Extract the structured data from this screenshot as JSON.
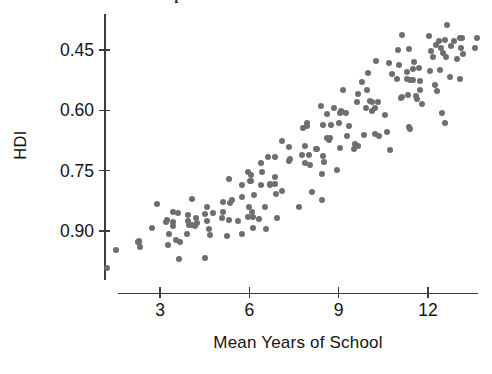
{
  "figure": {
    "caption_cutoff": "the HDI. Here is a scatterplot",
    "background_color": "#ffffff",
    "point_color": "#6e6e6e",
    "axis_color": "#3c3c3c"
  },
  "axes": {
    "y_title": "HDI",
    "x_title": "Mean Years of School",
    "y_ticks": [
      "0.90",
      "0.75",
      "0.60",
      "0.45"
    ],
    "x_ticks": [
      "3",
      "6",
      "9",
      "12"
    ]
  },
  "chart_data": {
    "type": "scatter",
    "title": "",
    "xlabel": "Mean Years of School",
    "ylabel": "HDI",
    "xlim": [
      1.2,
      13.6
    ],
    "ylim": [
      0.355,
      0.975
    ],
    "xticks": [
      3,
      6,
      9,
      12
    ],
    "yticks": [
      0.45,
      0.6,
      0.75,
      0.9
    ],
    "grid": false,
    "legend": false,
    "marker_color": "#6e6e6e",
    "marker_size": 6,
    "n_points": 186,
    "points": [
      [
        1.5,
        0.385
      ],
      [
        1.9,
        0.415
      ],
      [
        2.2,
        0.448
      ],
      [
        2.4,
        0.398
      ],
      [
        2.6,
        0.432
      ],
      [
        2.7,
        0.462
      ],
      [
        2.9,
        0.418
      ],
      [
        3.0,
        0.452
      ],
      [
        3.1,
        0.372
      ],
      [
        3.2,
        0.488
      ],
      [
        3.3,
        0.44
      ],
      [
        3.4,
        0.47
      ],
      [
        3.5,
        0.425
      ],
      [
        3.6,
        0.455
      ],
      [
        3.7,
        0.5
      ],
      [
        3.8,
        0.441
      ],
      [
        3.9,
        0.478
      ],
      [
        4.0,
        0.432
      ],
      [
        4.1,
        0.462
      ],
      [
        4.2,
        0.492
      ],
      [
        4.3,
        0.45
      ],
      [
        4.4,
        0.418
      ],
      [
        4.5,
        0.47
      ],
      [
        4.6,
        0.505
      ],
      [
        4.7,
        0.448
      ],
      [
        4.8,
        0.478
      ],
      [
        4.9,
        0.52
      ],
      [
        5.0,
        0.462
      ],
      [
        5.1,
        0.498
      ],
      [
        5.2,
        0.455
      ],
      [
        5.3,
        0.53
      ],
      [
        5.4,
        0.485
      ],
      [
        5.5,
        0.512
      ],
      [
        5.6,
        0.468
      ],
      [
        5.7,
        0.545
      ],
      [
        5.8,
        0.502
      ],
      [
        5.9,
        0.478
      ],
      [
        6.0,
        0.536
      ],
      [
        6.1,
        0.56
      ],
      [
        6.2,
        0.508
      ],
      [
        6.3,
        0.548
      ],
      [
        6.4,
        0.592
      ],
      [
        6.5,
        0.52
      ],
      [
        6.6,
        0.572
      ],
      [
        6.7,
        0.61
      ],
      [
        6.8,
        0.545
      ],
      [
        6.9,
        0.588
      ],
      [
        7.0,
        0.625
      ],
      [
        7.1,
        0.556
      ],
      [
        7.2,
        0.602
      ],
      [
        7.3,
        0.64
      ],
      [
        7.4,
        0.58
      ],
      [
        7.5,
        0.618
      ],
      [
        7.6,
        0.662
      ],
      [
        7.7,
        0.596
      ],
      [
        7.8,
        0.645
      ],
      [
        7.9,
        0.69
      ],
      [
        8.0,
        0.612
      ],
      [
        8.1,
        0.658
      ],
      [
        8.2,
        0.702
      ],
      [
        8.3,
        0.63
      ],
      [
        8.4,
        0.675
      ],
      [
        8.5,
        0.718
      ],
      [
        8.6,
        0.648
      ],
      [
        8.7,
        0.692
      ],
      [
        8.8,
        0.735
      ],
      [
        8.9,
        0.665
      ],
      [
        9.0,
        0.708
      ],
      [
        9.1,
        0.75
      ],
      [
        9.2,
        0.682
      ],
      [
        9.3,
        0.725
      ],
      [
        9.4,
        0.765
      ],
      [
        9.5,
        0.7
      ],
      [
        9.6,
        0.742
      ],
      [
        9.7,
        0.782
      ],
      [
        9.8,
        0.715
      ],
      [
        9.9,
        0.758
      ],
      [
        10.0,
        0.798
      ],
      [
        10.1,
        0.73
      ],
      [
        10.2,
        0.772
      ],
      [
        10.3,
        0.812
      ],
      [
        10.4,
        0.745
      ],
      [
        10.5,
        0.788
      ],
      [
        10.6,
        0.828
      ],
      [
        10.7,
        0.76
      ],
      [
        10.8,
        0.802
      ],
      [
        10.9,
        0.842
      ],
      [
        11.0,
        0.775
      ],
      [
        11.1,
        0.818
      ],
      [
        11.2,
        0.858
      ],
      [
        11.3,
        0.79
      ],
      [
        11.4,
        0.832
      ],
      [
        11.5,
        0.872
      ],
      [
        11.6,
        0.805
      ],
      [
        11.7,
        0.848
      ],
      [
        11.8,
        0.888
      ],
      [
        11.9,
        0.82
      ],
      [
        12.0,
        0.862
      ],
      [
        12.1,
        0.9
      ],
      [
        12.2,
        0.835
      ],
      [
        12.3,
        0.878
      ],
      [
        12.4,
        0.915
      ],
      [
        12.5,
        0.85
      ],
      [
        12.6,
        0.892
      ],
      [
        12.7,
        0.928
      ],
      [
        12.8,
        0.865
      ],
      [
        12.9,
        0.905
      ],
      [
        13.0,
        0.94
      ],
      [
        13.1,
        0.885
      ],
      [
        13.2,
        0.922
      ],
      [
        13.3,
        0.948
      ],
      [
        13.4,
        0.935
      ]
    ]
  }
}
